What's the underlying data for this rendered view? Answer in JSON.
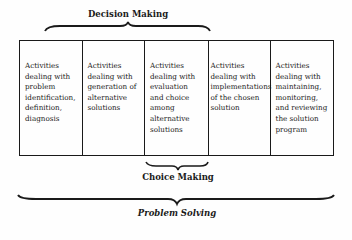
{
  "diagram": {
    "top_label": "Decision Making",
    "middle_label": "Choice Making",
    "bottom_label": "Problem Solving",
    "cells": [
      {
        "text": "Activities\ndealing with\nproblem\nidentification,\ndefinition,\ndiagnosis"
      },
      {
        "text": "Activities\ndealing with\ngeneration of\nalternative\nsolutions"
      },
      {
        "text": "Activities\ndealing with\nevaluation\nand choice\namong\nalternative\nsolutions"
      },
      {
        "text": "Activities\ndealing with\nimplementations\nof the chosen\nsolution"
      },
      {
        "text": "Activities\ndealing with\nmaintaining,\nmonitoring,\nand reviewing\nthe solution\nprogram"
      }
    ]
  }
}
